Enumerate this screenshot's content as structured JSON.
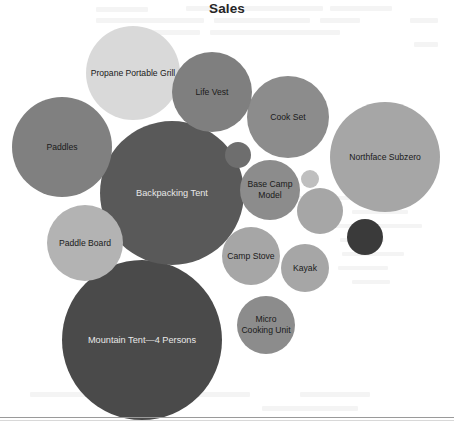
{
  "chart": {
    "title": "Sales"
  },
  "chart_data": {
    "type": "bar",
    "subtype": "circle-packing-bubble",
    "title": "Sales",
    "xlabel": "",
    "ylabel": "",
    "grid": false,
    "legend": "none",
    "note": "Packed-circle (bubble) chart of Sales by product. Bubble area encodes sales magnitude; radii read off the rendered image in pixels. Several small bubbles are rendered without visible labels.",
    "categories": [
      "Mountain Tent—4 Persons",
      "Backpacking Tent",
      "Northface Subzero",
      "Propane Portable Grill",
      "Cook Set",
      "Paddles",
      "Life Vest",
      "Paddle Board",
      "Base Camp Model",
      "Camp Stove",
      "Micro Cooking Unit",
      "Kayak"
    ],
    "values": [
      80,
      72,
      55,
      47,
      41,
      40,
      40,
      38,
      30,
      29,
      29,
      24
    ],
    "value_units": "relative bubble radius (px)",
    "bubbles": [
      {
        "label": "Propane Portable Grill",
        "cx": 133,
        "cy": 73,
        "r": 47,
        "color": "#d9d9d9",
        "text_color": "dark",
        "labeled": true
      },
      {
        "label": "Life Vest",
        "cx": 212,
        "cy": 92,
        "r": 40,
        "color": "#7f7f7f",
        "text_color": "dark",
        "labeled": true
      },
      {
        "label": "Cook Set",
        "cx": 288,
        "cy": 117,
        "r": 41,
        "color": "#8c8c8c",
        "text_color": "dark",
        "labeled": true
      },
      {
        "label": "Northface Subzero",
        "cx": 385,
        "cy": 157,
        "r": 55,
        "color": "#a6a6a6",
        "text_color": "dark",
        "labeled": true
      },
      {
        "label": "Paddles",
        "cx": 62,
        "cy": 147,
        "r": 50,
        "color": "#808080",
        "text_color": "dark",
        "labeled": true
      },
      {
        "label": "Backpacking Tent",
        "cx": 172,
        "cy": 193,
        "r": 72,
        "color": "#595959",
        "text_color": "light",
        "labeled": true
      },
      {
        "label": "",
        "cx": 238,
        "cy": 155,
        "r": 13,
        "color": "#6e6e6e",
        "text_color": "dark",
        "labeled": false
      },
      {
        "label": "Base Camp Model",
        "cx": 270,
        "cy": 190,
        "r": 30,
        "color": "#8c8c8c",
        "text_color": "dark",
        "labeled": true
      },
      {
        "label": "",
        "cx": 310,
        "cy": 179,
        "r": 9,
        "color": "#bfbfbf",
        "text_color": "dark",
        "labeled": false
      },
      {
        "label": "",
        "cx": 320,
        "cy": 211,
        "r": 23,
        "color": "#a6a6a6",
        "text_color": "dark",
        "labeled": false
      },
      {
        "label": "",
        "cx": 365,
        "cy": 237,
        "r": 18,
        "color": "#3a3a3a",
        "text_color": "light",
        "labeled": false
      },
      {
        "label": "Paddle Board",
        "cx": 85,
        "cy": 243,
        "r": 38,
        "color": "#b3b3b3",
        "text_color": "dark",
        "labeled": true
      },
      {
        "label": "Camp Stove",
        "cx": 251,
        "cy": 256,
        "r": 29,
        "color": "#a6a6a6",
        "text_color": "dark",
        "labeled": true
      },
      {
        "label": "Kayak",
        "cx": 305,
        "cy": 268,
        "r": 24,
        "color": "#a6a6a6",
        "text_color": "dark",
        "labeled": true
      },
      {
        "label": "Mountain Tent—4 Persons",
        "cx": 142,
        "cy": 340,
        "r": 80,
        "color": "#4a4a4a",
        "text_color": "light",
        "labeled": true
      },
      {
        "label": "Micro Cooking Unit",
        "cx": 266,
        "cy": 325,
        "r": 29,
        "color": "#8c8c8c",
        "text_color": "dark",
        "labeled": true
      }
    ]
  }
}
